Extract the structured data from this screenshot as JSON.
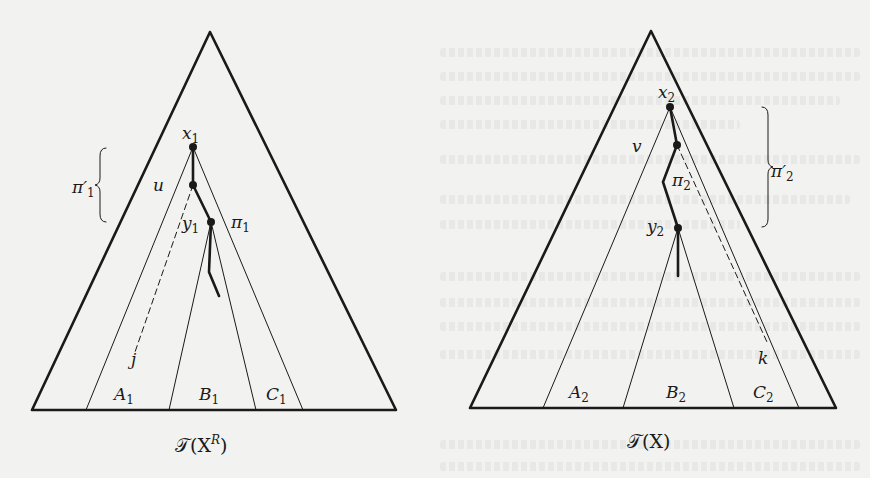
{
  "figure": {
    "background_color": "#f2f2f0",
    "ink_color": "#1a1a1a",
    "left_tree": {
      "caption": "T(X^R)",
      "caption_main": "𝒯(X",
      "caption_sup": "R",
      "caption_close": ")",
      "nodes": {
        "x": {
          "label": "x",
          "sub": "1"
        },
        "u": {
          "label": "u"
        },
        "y": {
          "label": "y",
          "sub": "1"
        },
        "j": {
          "label": "j"
        }
      },
      "path_labels": {
        "pi": {
          "label": "π",
          "sub": "1"
        },
        "pi_prime": {
          "label": "π′",
          "sub": "1"
        }
      },
      "regions": [
        {
          "label": "A",
          "sub": "1"
        },
        {
          "label": "B",
          "sub": "1"
        },
        {
          "label": "C",
          "sub": "1"
        }
      ]
    },
    "right_tree": {
      "caption": "T(X)",
      "caption_main": "𝒯(X)",
      "nodes": {
        "x": {
          "label": "x",
          "sub": "2"
        },
        "v": {
          "label": "v"
        },
        "y": {
          "label": "y",
          "sub": "2"
        },
        "k": {
          "label": "k"
        }
      },
      "path_labels": {
        "pi": {
          "label": "π",
          "sub": "2"
        },
        "pi_prime": {
          "label": "π′",
          "sub": "2"
        }
      },
      "regions": [
        {
          "label": "A",
          "sub": "2"
        },
        {
          "label": "B",
          "sub": "2"
        },
        {
          "label": "C",
          "sub": "2"
        }
      ]
    }
  }
}
